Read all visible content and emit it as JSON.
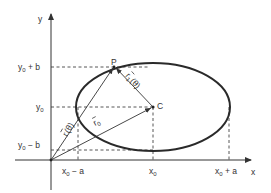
{
  "diagram": {
    "type": "ellipse-position-vectors",
    "colors": {
      "stroke": "#333333",
      "ellipse": "#2a2a2a",
      "dashed": "#444444",
      "background": "#ffffff"
    },
    "axes": {
      "x_label": "x",
      "y_label": "y"
    },
    "y_ticks": [
      {
        "base": "y",
        "sub": "0",
        "suffix": " + b"
      },
      {
        "base": "y",
        "sub": "0",
        "suffix": ""
      },
      {
        "base": "y",
        "sub": "0",
        "suffix": " − b"
      }
    ],
    "x_ticks": [
      {
        "base": "x",
        "sub": "0",
        "suffix": " − a"
      },
      {
        "base": "x",
        "sub": "0",
        "suffix": ""
      },
      {
        "base": "x",
        "sub": "0",
        "suffix": " + a"
      }
    ],
    "points": {
      "center": "C",
      "on_ellipse": "P"
    },
    "vectors": {
      "r_of_theta": {
        "symbol": "r",
        "arg": "(θ)"
      },
      "r1_of_theta": {
        "symbol": "r",
        "sub": "1",
        "arg": "(θ)"
      },
      "r0": {
        "symbol": "r",
        "sub": "0"
      }
    }
  }
}
